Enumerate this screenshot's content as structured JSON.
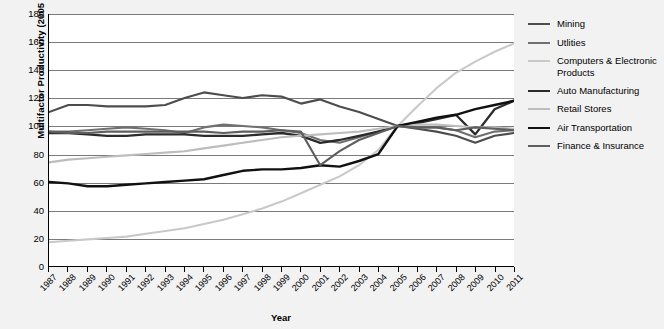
{
  "chart_data": {
    "type": "line",
    "title": "",
    "xlabel": "Year",
    "ylabel": "Multifactor Productivity (2005 = 100)",
    "ylim": [
      0,
      180
    ],
    "ytick_step": 20,
    "yticks": [
      0,
      20,
      40,
      60,
      80,
      100,
      120,
      140,
      160,
      180
    ],
    "grid": "horizontal",
    "legend_position": "right",
    "x": [
      1987,
      1988,
      1989,
      1990,
      1991,
      1992,
      1993,
      1994,
      1995,
      1996,
      1997,
      1998,
      1999,
      2000,
      2001,
      2002,
      2003,
      2004,
      2005,
      2006,
      2007,
      2008,
      2009,
      2010,
      2011
    ],
    "categories": [
      "1987",
      "1988",
      "1989",
      "1990",
      "1991",
      "1992",
      "1993",
      "1994",
      "1995",
      "1996",
      "1997",
      "1998",
      "1999",
      "2000",
      "2001",
      "2002",
      "2003",
      "2004",
      "2005",
      "2006",
      "2007",
      "2008",
      "2009",
      "2010",
      "2011"
    ],
    "series": [
      {
        "name": "Mining",
        "color": "#4d4d4d",
        "width": 2.1,
        "values": [
          110,
          115,
          115,
          114,
          114,
          114,
          115,
          120,
          124,
          122,
          120,
          122,
          121,
          116,
          119,
          114,
          110,
          105,
          100,
          98,
          96,
          93,
          88,
          93,
          95
        ]
      },
      {
        "name": "Utlities",
        "color": "#707070",
        "width": 2.1,
        "values": [
          96,
          96,
          97,
          98,
          99,
          98,
          97,
          95,
          99,
          101,
          100,
          99,
          97,
          95,
          90,
          88,
          92,
          96,
          100,
          99,
          99,
          97,
          92,
          96,
          97
        ]
      },
      {
        "name": "Computers & Electronic Products",
        "color": "#c9c9c9",
        "width": 2.1,
        "values": [
          17,
          18,
          19,
          20,
          21,
          23,
          25,
          27,
          30,
          33,
          37,
          41,
          46,
          52,
          58,
          64,
          72,
          83,
          100,
          114,
          127,
          138,
          146,
          153,
          159
        ]
      },
      {
        "name": "Auto Manufacturing",
        "color": "#2b2b2b",
        "width": 2.3,
        "values": [
          95,
          95,
          94,
          93,
          93,
          94,
          94,
          94,
          93,
          93,
          93,
          94,
          95,
          93,
          88,
          90,
          93,
          96,
          100,
          102,
          105,
          108,
          94,
          112,
          118
        ]
      },
      {
        "name": "Retail Stores",
        "color": "#bdbdbd",
        "width": 2.1,
        "values": [
          74,
          76,
          77,
          78,
          79,
          80,
          81,
          82,
          84,
          86,
          88,
          90,
          92,
          93,
          94,
          95,
          96,
          98,
          100,
          101,
          101,
          100,
          99,
          99,
          98
        ]
      },
      {
        "name": "Air Transportation",
        "color": "#111111",
        "width": 2.4,
        "values": [
          60,
          59,
          57,
          57,
          58,
          59,
          60,
          61,
          62,
          65,
          68,
          69,
          69,
          70,
          72,
          71,
          75,
          80,
          100,
          103,
          106,
          108,
          112,
          115,
          118
        ]
      },
      {
        "name": "Finance & Insurance",
        "color": "#5e5e5e",
        "width": 2.1,
        "values": [
          96,
          95,
          95,
          96,
          96,
          96,
          96,
          96,
          96,
          95,
          96,
          96,
          97,
          96,
          72,
          82,
          90,
          95,
          100,
          99,
          99,
          97,
          99,
          98,
          97
        ]
      }
    ]
  },
  "legend": {
    "items": [
      {
        "label": "Mining"
      },
      {
        "label": "Utlities"
      },
      {
        "label": "Computers & Electronic Products"
      },
      {
        "label": "Auto Manufacturing"
      },
      {
        "label": "Retail Stores"
      },
      {
        "label": "Air Transportation"
      },
      {
        "label": "Finance & Insurance"
      }
    ]
  },
  "theme": {
    "background": "#f2f2f2",
    "plot_background": "#ffffff",
    "axis_color": "#000000",
    "gridline_color": "#7a7a7a"
  }
}
